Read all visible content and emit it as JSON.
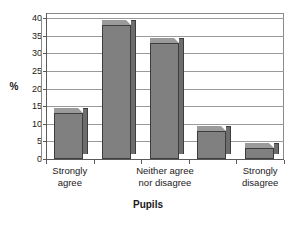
{
  "chart_data": {
    "type": "bar",
    "title": "",
    "subtitle": "",
    "xlabel": "Pupils",
    "ylabel": "%",
    "categories": [
      "Strongly agree",
      "Agree",
      "Neither agree nor disagree",
      "Disagree",
      "Strongly disagree"
    ],
    "category_lines": [
      [
        "Strongly",
        "agree"
      ],
      [
        "",
        ""
      ],
      [
        "Neither agree",
        "nor disagree"
      ],
      [
        "",
        ""
      ],
      [
        "Strongly",
        "disagree"
      ]
    ],
    "visible_category_labels": [
      "Strongly agree",
      "Neither agree nor disagree",
      "Strongly disagree"
    ],
    "values": [
      13,
      38,
      33,
      8,
      3
    ],
    "ylim": [
      0,
      40
    ],
    "ytick_labels": [
      "0",
      "5",
      "10",
      "15",
      "20",
      "25",
      "30",
      "35",
      "40"
    ],
    "ytick_values": [
      0,
      5,
      10,
      15,
      20,
      25,
      30,
      35,
      40
    ],
    "grid": true,
    "grid_axis": "y",
    "legend": false,
    "legend_position": "none",
    "style": "3d-column",
    "colors": {
      "bar_front": "#808080",
      "bar_top": "#9b9b9b",
      "bar_side": "#6d6d6d",
      "bar_outline": "#3d3d3d",
      "gridline": "#9a9a9a",
      "axis": "#5a5a5a",
      "plot_background": "#ffffff",
      "figure_background": "#ffffff",
      "text": "#1a1a1a"
    }
  }
}
